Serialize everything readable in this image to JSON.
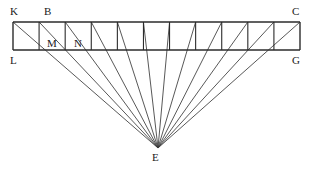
{
  "figure": {
    "type": "geometric-line-diagram",
    "canvas": {
      "width": 314,
      "height": 171
    },
    "colors": {
      "background": "#ffffff",
      "stroke": "#3a3a3a",
      "strip_stroke": "#2b2b2b",
      "label": "#1a1a1a"
    },
    "strip": {
      "name": "KLGC",
      "left": 13,
      "right": 300,
      "top": 22,
      "bottom": 50,
      "cell_count": 11,
      "top_edge": "KC",
      "bottom_edge": "LG",
      "corners": {
        "top_left": "K",
        "top_right": "C",
        "bottom_left": "L",
        "bottom_right": "G"
      }
    },
    "apex": {
      "label": "E",
      "x": 158,
      "y": 148
    },
    "labels": [
      {
        "text": "K",
        "x": 10,
        "y": 6,
        "name": "vertex-label-k"
      },
      {
        "text": "B",
        "x": 44,
        "y": 6,
        "name": "vertex-label-b"
      },
      {
        "text": "C",
        "x": 292,
        "y": 6,
        "name": "vertex-label-c"
      },
      {
        "text": "M",
        "x": 47,
        "y": 38,
        "name": "vertex-label-m"
      },
      {
        "text": "N",
        "x": 74,
        "y": 38,
        "name": "vertex-label-n"
      },
      {
        "text": "L",
        "x": 10,
        "y": 55,
        "name": "vertex-label-l"
      },
      {
        "text": "G",
        "x": 292,
        "y": 55,
        "name": "vertex-label-g"
      },
      {
        "text": "E",
        "x": 152,
        "y": 152,
        "name": "vertex-label-e"
      }
    ]
  }
}
